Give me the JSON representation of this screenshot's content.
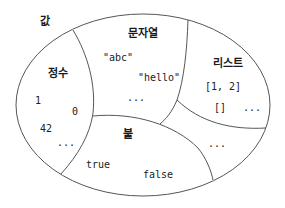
{
  "diagram": {
    "title": "값",
    "stroke_color": "#555555",
    "regions": {
      "integer": {
        "label": "정수",
        "examples": [
          "1",
          "0",
          "42",
          "..."
        ]
      },
      "string": {
        "label": "문자열",
        "examples": [
          "\"abc\"",
          "\"hello\"",
          "..."
        ]
      },
      "list": {
        "label": "리스트",
        "examples": [
          "[1, 2]",
          "[]",
          "..."
        ]
      },
      "boolean": {
        "label": "불",
        "examples": [
          "true",
          "false"
        ]
      },
      "other": {
        "examples": [
          "..."
        ]
      }
    }
  }
}
